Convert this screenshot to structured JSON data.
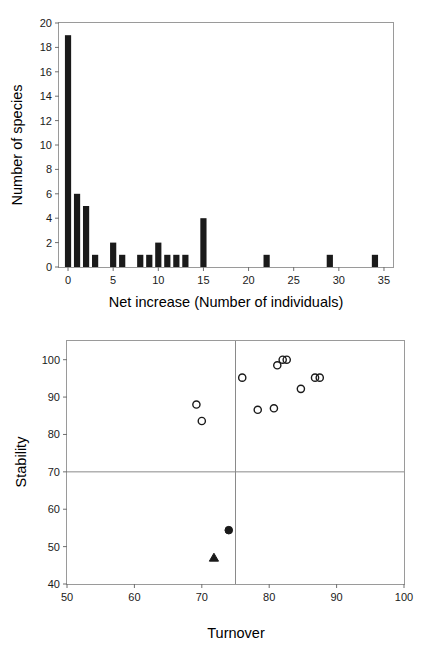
{
  "chart_data": [
    {
      "id": "histogram",
      "type": "bar",
      "title": "",
      "xlabel": "Net increase (Number of individuals)",
      "ylabel": "Number of species",
      "xlim": [
        -1,
        36
      ],
      "ylim": [
        0,
        20
      ],
      "xticks": [
        0,
        5,
        10,
        15,
        20,
        25,
        30,
        35
      ],
      "yticks": [
        0,
        2,
        4,
        6,
        8,
        10,
        12,
        14,
        16,
        18,
        20
      ],
      "grid": false,
      "legend": "none",
      "bar_color": "#1a1a1a",
      "categories": [
        0,
        1,
        2,
        3,
        5,
        6,
        8,
        9,
        10,
        11,
        12,
        13,
        15,
        22,
        29,
        34
      ],
      "values": [
        19,
        6,
        5,
        1,
        2,
        1,
        1,
        1,
        2,
        1,
        1,
        1,
        4,
        1,
        1,
        1
      ]
    },
    {
      "id": "scatter",
      "type": "scatter",
      "title": "",
      "xlabel": "Turnover",
      "ylabel": "Stability",
      "xlim": [
        50,
        100
      ],
      "ylim": [
        40,
        105
      ],
      "xticks": [
        50,
        60,
        70,
        80,
        90,
        100
      ],
      "yticks": [
        40,
        50,
        60,
        70,
        80,
        90,
        100
      ],
      "grid": false,
      "legend": "none",
      "reference_lines": {
        "vertical_x": 75,
        "horizontal_y": 70,
        "color": "#8a8a8a"
      },
      "series": [
        {
          "name": "open-circles",
          "marker": "open-circle",
          "color": "#1a1a1a",
          "points": [
            [
              69.2,
              88.0
            ],
            [
              70.0,
              83.6
            ],
            [
              76.0,
              95.2
            ],
            [
              78.3,
              86.6
            ],
            [
              80.7,
              87.0
            ],
            [
              81.2,
              98.5
            ],
            [
              82.0,
              100.0
            ],
            [
              82.6,
              100.0
            ],
            [
              84.7,
              92.2
            ],
            [
              86.8,
              95.2
            ],
            [
              87.5,
              95.2
            ]
          ]
        },
        {
          "name": "filled-circle",
          "marker": "filled-circle",
          "color": "#1a1a1a",
          "points": [
            [
              74.0,
              54.4
            ]
          ]
        },
        {
          "name": "filled-triangle",
          "marker": "filled-triangle",
          "color": "#1a1a1a",
          "points": [
            [
              71.8,
              47.0
            ]
          ]
        }
      ]
    }
  ],
  "histogram": {
    "ylabel": "Number of species",
    "xlabel": "Net increase (Number of individuals)",
    "xticks": [
      "0",
      "5",
      "10",
      "15",
      "20",
      "25",
      "30",
      "35"
    ],
    "yticks": [
      "0",
      "2",
      "4",
      "6",
      "8",
      "10",
      "12",
      "14",
      "16",
      "18",
      "20"
    ]
  },
  "scatter": {
    "ylabel": "Stability",
    "xlabel": "Turnover",
    "xticks": [
      "50",
      "60",
      "70",
      "80",
      "90",
      "100"
    ],
    "yticks": [
      "40",
      "50",
      "60",
      "70",
      "80",
      "90",
      "100"
    ]
  }
}
